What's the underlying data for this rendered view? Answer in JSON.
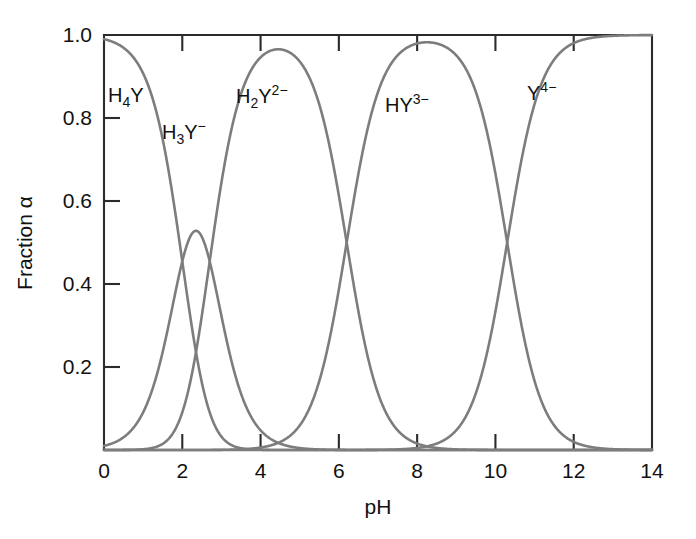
{
  "chart_data": {
    "type": "line",
    "title": "",
    "subtitle": "",
    "xlabel": "pH",
    "ylabel": "Fraction α",
    "xlim": [
      0,
      14
    ],
    "ylim": [
      0,
      1.0
    ],
    "grid": false,
    "legend_position": "inline-annotations",
    "xticks": [
      0,
      2,
      4,
      6,
      8,
      10,
      12,
      14
    ],
    "xticklabels": [
      "0",
      "2",
      "4",
      "6",
      "8",
      "10",
      "12",
      "14"
    ],
    "yticks": [
      0.2,
      0.4,
      0.6,
      0.8,
      1.0
    ],
    "yticklabels": [
      "0.2",
      "0.4",
      "0.6",
      "0.8",
      "1.0"
    ],
    "curve_color": "#7d7d7d",
    "axis_color": "#2b2b2b",
    "pKa": [
      2.0,
      2.7,
      6.2,
      10.3
    ],
    "annotations": [
      {
        "id": "h4y",
        "base": "H",
        "sub": "4",
        "core": "Y",
        "sup": "",
        "x_px": 108,
        "y_px": 102,
        "text": "H4Y"
      },
      {
        "id": "h3y",
        "base": "H",
        "sub": "3",
        "core": "Y",
        "sup": "−",
        "x_px": 162,
        "y_px": 139,
        "text": "H3Y-"
      },
      {
        "id": "h2y",
        "base": "H",
        "sub": "2",
        "core": "Y",
        "sup": "2−",
        "x_px": 236,
        "y_px": 103,
        "text": "H2Y2-"
      },
      {
        "id": "hy",
        "base": "H",
        "sub": "",
        "core": "Y",
        "sup": "3−",
        "x_px": 385,
        "y_px": 112,
        "text": "HY3-"
      },
      {
        "id": "y",
        "base": "",
        "sub": "",
        "core": "Y",
        "sup": "4−",
        "x_px": 527,
        "y_px": 100,
        "text": "Y4-"
      }
    ],
    "series": [
      {
        "name": "H4Y",
        "label_text": "H₄Y"
      },
      {
        "name": "H3Y-",
        "label_text": "H₃Y⁻"
      },
      {
        "name": "H2Y2-",
        "label_text": "H₂Y²⁻"
      },
      {
        "name": "HY3-",
        "label_text": "HY³⁻"
      },
      {
        "name": "Y4-",
        "label_text": "Y⁴⁻"
      }
    ],
    "key_points": {
      "h3y_peak": {
        "pH": 2.5,
        "alpha": 0.72
      },
      "h2y_peak": {
        "pH": 4.5,
        "alpha": 0.96
      },
      "hy_peak": {
        "pH": 8.0,
        "alpha": 1.0
      },
      "crossing_h2y_hy": {
        "pH": 6.2,
        "alpha": 0.5
      },
      "crossing_hy_y": {
        "pH": 10.3,
        "alpha": 0.5
      }
    }
  },
  "plot_box": {
    "left_px": 104,
    "right_px": 652,
    "top_px": 35,
    "bottom_px": 450
  }
}
